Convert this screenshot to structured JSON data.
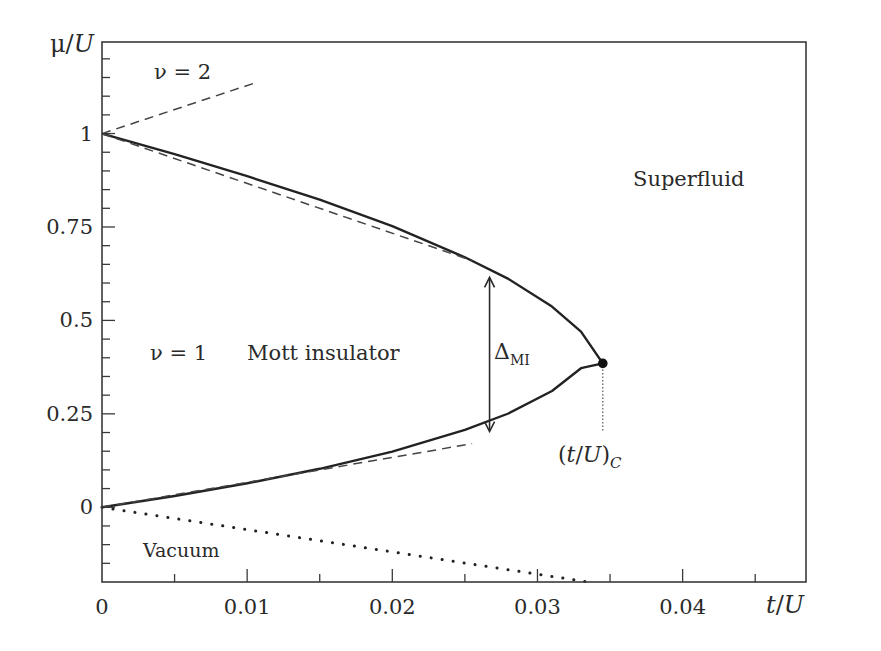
{
  "chart_data": {
    "type": "line",
    "title": "",
    "xlabel": "t/U",
    "ylabel": "μ/U",
    "xlim": [
      0,
      0.0485
    ],
    "ylim": [
      -0.2,
      1.245
    ],
    "x_ticks": [
      {
        "value": 0,
        "label": "0"
      },
      {
        "value": 0.01,
        "label": "0.01"
      },
      {
        "value": 0.02,
        "label": "0.02"
      },
      {
        "value": 0.03,
        "label": "0.03"
      },
      {
        "value": 0.04,
        "label": "0.04"
      }
    ],
    "x_minor_step": 0.005,
    "y_ticks": [
      {
        "value": 0,
        "label": "0"
      },
      {
        "value": 0.25,
        "label": "0.25"
      },
      {
        "value": 0.5,
        "label": "0.5"
      },
      {
        "value": 0.75,
        "label": "0.75"
      },
      {
        "value": 1,
        "label": "1"
      }
    ],
    "y_minor_step": 0.05,
    "grid": false,
    "series": [
      {
        "name": "Mott lobe boundary (upper branch)",
        "style": "solid",
        "x": [
          0,
          0.005,
          0.01,
          0.015,
          0.02,
          0.025,
          0.028,
          0.031,
          0.033,
          0.0345
        ],
        "y": [
          1.0,
          0.945,
          0.886,
          0.823,
          0.752,
          0.669,
          0.611,
          0.537,
          0.47,
          0.385
        ]
      },
      {
        "name": "Mott lobe boundary (lower branch)",
        "style": "solid",
        "x": [
          0,
          0.005,
          0.01,
          0.015,
          0.02,
          0.025,
          0.028,
          0.031,
          0.033,
          0.0345
        ],
        "y": [
          0.0,
          0.03,
          0.064,
          0.103,
          0.149,
          0.207,
          0.251,
          0.311,
          0.372,
          0.385
        ]
      },
      {
        "name": "Perturbative upper (ν=1)",
        "style": "dashed",
        "x": [
          0,
          0.0255
        ],
        "y": [
          1.0,
          0.66
        ]
      },
      {
        "name": "Perturbative lower (ν=1)",
        "style": "dashed",
        "x": [
          0,
          0.0255
        ],
        "y": [
          0.0,
          0.17
        ]
      },
      {
        "name": "Perturbative lower (ν=2)",
        "style": "dashed",
        "x": [
          0,
          0.0105
        ],
        "y": [
          1.0,
          1.135
        ]
      },
      {
        "name": "Vacuum boundary",
        "style": "dotted",
        "x": [
          0,
          0.0335
        ],
        "y": [
          0.0,
          -0.2
        ]
      }
    ],
    "critical_point": {
      "x": 0.0345,
      "y": 0.385,
      "label": "(t/U)_C"
    },
    "gap_arrow": {
      "x": 0.0267,
      "y_low": 0.2,
      "y_high": 0.618,
      "label": "Δ_MI"
    },
    "annotations": [
      {
        "text": "ν = 2",
        "x": 0.0045,
        "y": 1.17
      },
      {
        "text": "ν = 1",
        "x": 0.004,
        "y": 0.42
      },
      {
        "text": "Mott insulator",
        "x": 0.0145,
        "y": 0.42
      },
      {
        "text": "Superfluid",
        "x": 0.0425,
        "y": 0.88
      },
      {
        "text": "Vacuum",
        "x": 0.0037,
        "y": -0.115
      }
    ]
  },
  "labels": {
    "ylabel_mu": "μ",
    "ylabel_slash": "/",
    "ylabel_U": "U",
    "xlabel_t": "t",
    "xlabel_slash": "/",
    "xlabel_U": "U",
    "nu2": "ν = 2",
    "nu1": "ν = 1",
    "mott": "Mott insulator",
    "superfluid": "Superfluid",
    "vacuum": "Vacuum",
    "delta": "Δ",
    "delta_sub": "MI",
    "crit_open": "(",
    "crit_t": "t",
    "crit_slash": "/",
    "crit_U": "U",
    "crit_close": ")",
    "crit_sub": "C"
  }
}
